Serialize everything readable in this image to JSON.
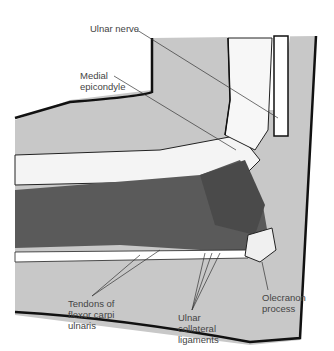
{
  "diagram": {
    "labels": {
      "ulnar_nerve": "Ulnar nerve",
      "medial_epicondyle": "Medial\nepicondyle",
      "tendons_fcu": "Tendons of\nflexor carpi\nulnaris",
      "ulnar_collateral": "Ulnar\ncollateral\nligaments",
      "olecranon": "Olecranon\nprocess"
    },
    "colors": {
      "skin_fill": "#c8c8c8",
      "muscle_fill": "#5a5a5a",
      "outline": "#111111",
      "leader": "#333333"
    }
  }
}
